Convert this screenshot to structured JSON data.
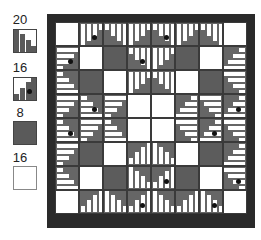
{
  "legend": {
    "items": [
      {
        "label": "20",
        "type": "striped-20"
      },
      {
        "label": "16",
        "type": "striped-16-dot"
      },
      {
        "label": "8",
        "type": "dark"
      },
      {
        "label": "16",
        "type": "white"
      }
    ]
  },
  "quilt": {
    "rows": 8,
    "cols": 8,
    "cells": [
      [
        "W",
        "S",
        "S",
        "S",
        "S",
        "S",
        "S",
        "W"
      ],
      [
        "S",
        "W",
        "D",
        "S",
        "S",
        "D",
        "W",
        "S"
      ],
      [
        "S",
        "D",
        "W",
        "S",
        "S",
        "W",
        "D",
        "S"
      ],
      [
        "S",
        "S",
        "S",
        "W",
        "W",
        "S",
        "S",
        "S"
      ],
      [
        "S",
        "S",
        "S",
        "W",
        "W",
        "S",
        "S",
        "S"
      ],
      [
        "S",
        "D",
        "W",
        "S",
        "S",
        "W",
        "D",
        "S"
      ],
      [
        "S",
        "W",
        "D",
        "S",
        "S",
        "D",
        "W",
        "S"
      ],
      [
        "W",
        "S",
        "S",
        "S",
        "S",
        "S",
        "S",
        "W"
      ]
    ],
    "colors": {
      "dark": "#5c5c5c",
      "white": "#ffffff",
      "border": "#2a2a2a",
      "stripe_dark": "#666666"
    }
  }
}
